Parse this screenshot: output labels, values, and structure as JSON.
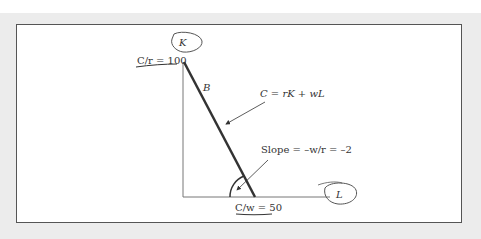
{
  "diagram": {
    "axes": {
      "y_label": "K",
      "x_label": "L",
      "y_intercept_label": "C/r = 100",
      "x_intercept_label": "C/w = 50"
    },
    "line_label": "B",
    "equation_label": "C = rK  + wL",
    "slope_label": "Slope = –w/r = –2",
    "colors": {
      "frame": "#ececec",
      "panel": "#ffffff",
      "border": "#555555",
      "budget_line": "#333333",
      "axis": "#777777",
      "text": "#333333"
    }
  }
}
